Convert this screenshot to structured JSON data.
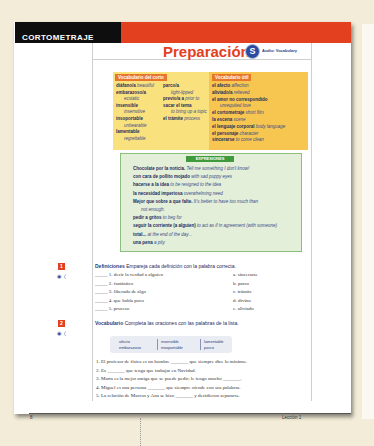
{
  "header": {
    "section_label": "CORTOMETRAJE",
    "title": "Preparación",
    "audio_badge": "S",
    "audio_label": "Audio: Vocabulary"
  },
  "colors": {
    "accent_red": "#e3401f",
    "banner_black": "#0e0e0e",
    "vocab_yellow": "#f9e27d",
    "vocab_orange": "#f7c650",
    "expr_green": "#3f9a3d",
    "text_navy": "#1f2a5c"
  },
  "vocab_corto": {
    "heading": "Vocabulario del corto",
    "col1": [
      {
        "term": "diáfano/a",
        "meaning": "beautiful"
      },
      {
        "term": "embarazoso/a",
        "meaning": ""
      },
      {
        "term": "",
        "meaning": "ecstatic"
      },
      {
        "term": "insensible",
        "meaning": ""
      },
      {
        "term": "",
        "meaning": "insensitive"
      },
      {
        "term": "insoportable",
        "meaning": ""
      },
      {
        "term": "",
        "meaning": "unbearable"
      },
      {
        "term": "lamentable",
        "meaning": ""
      },
      {
        "term": "",
        "meaning": "regrettable"
      }
    ],
    "col2": [
      {
        "term": "parco/a",
        "meaning": ""
      },
      {
        "term": "",
        "meaning": "tight-lipped"
      },
      {
        "term": "previo/a a",
        "meaning": "prior to"
      },
      {
        "term": "sacar el tema",
        "meaning": ""
      },
      {
        "term": "",
        "meaning": "to bring up a topic"
      },
      {
        "term": "el trámite",
        "meaning": "process"
      }
    ]
  },
  "vocab_util": {
    "heading": "Vocabulario útil",
    "items": [
      {
        "term": "el afecto",
        "meaning": "affection"
      },
      {
        "term": "aliviado/a",
        "meaning": "relieved"
      },
      {
        "term": "el amor no correspondido",
        "meaning": ""
      },
      {
        "term": "",
        "meaning": "unrequited love"
      },
      {
        "term": "el cortometraje",
        "meaning": "short film"
      },
      {
        "term": "la escena",
        "meaning": "scene"
      },
      {
        "term": "el lenguaje corporal",
        "meaning": "body language"
      },
      {
        "term": "el personaje",
        "meaning": "character"
      },
      {
        "term": "sincerarse",
        "meaning": "to come clean"
      }
    ]
  },
  "expresiones": {
    "heading": "EXPRESIONES",
    "items": [
      {
        "term": "Chocolate por la noticia.",
        "meaning": "Tell me something I don't know!"
      },
      {
        "term": "con cara de pollito mojado",
        "meaning": "with sad puppy eyes"
      },
      {
        "term": "hacerse a la idea",
        "meaning": "to be resigned to the idea"
      },
      {
        "term": "la necesidad imperiosa",
        "meaning": "overwhelming need"
      },
      {
        "term": "Mejor que sobre a que falte.",
        "meaning": "It's better to have too much than"
      },
      {
        "term": "",
        "meaning": "not enough."
      },
      {
        "term": "pedir a gritos",
        "meaning": "to beg for"
      },
      {
        "term": "seguir la corriente (a alguien)",
        "meaning": "to act as if in agreement (with someone)"
      },
      {
        "term": "total...",
        "meaning": "at the end of the day..."
      },
      {
        "term": "una pena",
        "meaning": "a pity"
      }
    ]
  },
  "exercise1": {
    "number": "1",
    "title": "Definiciones",
    "instruction": "Empareja cada definición con la palabra correcta.",
    "left": [
      "_____ 1. decir la verdad a alguien",
      "_____ 2. fantástico",
      "_____ 3. liberado de algo",
      "_____ 4. que habla poco",
      "_____ 5. proceso"
    ],
    "right": [
      "a. sincerarse",
      "b. parco",
      "c. trámite",
      "d. divino",
      "e. aliviado"
    ]
  },
  "exercise2": {
    "number": "2",
    "title": "Vocabulario",
    "instruction": "Completa las oraciones con las palabras de la lista.",
    "word_bank": [
      [
        "afecto",
        "embarazoso"
      ],
      [
        "insensible",
        "insoportable"
      ],
      [
        "lamentable",
        "parco"
      ]
    ],
    "sentences": [
      "1. El profesor de física es un hombre _______ que siempre dice lo mínimo.",
      "2. Es _______ que tenga que trabajar en Navidad.",
      "3. Marta es la mejor amiga que se puede pedir; le tengo mucho _______.",
      "4. Miguel es una persona _______ que siempre ofende con sus palabras.",
      "5. La relación de Marcos y Ana se hizo _______ y decidieron separarse."
    ]
  },
  "footer": {
    "page_number": "8",
    "lesson": "Lección 1"
  }
}
